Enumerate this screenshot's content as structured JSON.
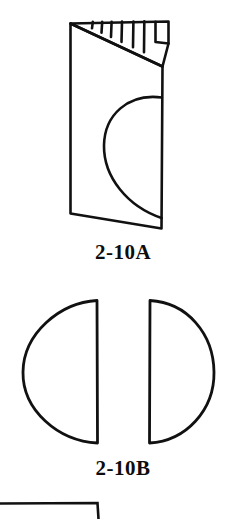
{
  "plate": {
    "background_color": "#ffffff",
    "ink_color": "#111111",
    "style": "line-art-technical-illustration"
  },
  "figures": [
    {
      "id": "fig-a",
      "caption": "2-10A",
      "description": "folded card in perspective with D-shaped half-round cutout and hatched top fold edge",
      "icon_name": "folded-card-with-half-round-cutout",
      "details": {
        "hatch_marks": 5,
        "has_flap": true,
        "cutout_shape": "half-round"
      }
    },
    {
      "id": "fig-b",
      "caption": "2-10B",
      "description": "two mirrored semicircles with flat edges facing inward",
      "icon_name": "mirrored-semicircle-pair",
      "details": {
        "shape_count": 2,
        "left_shape": "semicircle-flat-right",
        "right_shape": "semicircle-flat-left"
      }
    },
    {
      "id": "fig-c",
      "caption": "",
      "description": "top-left corner of a rectangle, cropped by the bottom page edge",
      "icon_name": "partial-rectangle-corner",
      "details": {
        "cropped": true,
        "visible_edges": "top-and-right-corner"
      }
    }
  ],
  "captions": {
    "figure_a": "2-10A",
    "figure_b": "2-10B"
  }
}
